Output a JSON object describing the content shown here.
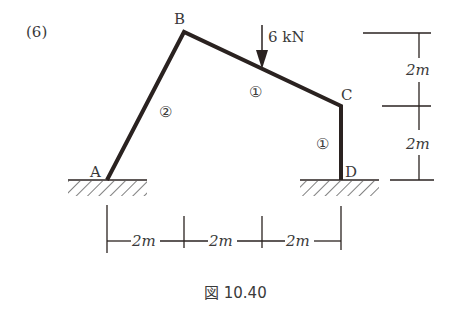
{
  "problem_label": "(6)",
  "nodes": {
    "A": {
      "label": "A"
    },
    "B": {
      "label": "B"
    },
    "C": {
      "label": "C"
    },
    "D": {
      "label": "D"
    }
  },
  "members": [
    {
      "id": "AB",
      "stiffness_label": "②"
    },
    {
      "id": "BC",
      "stiffness_label": "①"
    },
    {
      "id": "CD",
      "stiffness_label": "①"
    }
  ],
  "load": {
    "label": "6 kN",
    "value": 6,
    "unit": "kN",
    "direction": "down"
  },
  "dimensions": {
    "horizontal": [
      "2m",
      "2m",
      "2m"
    ],
    "vertical": [
      "2m",
      "2m"
    ]
  },
  "caption": "図 10.40",
  "colors": {
    "line": "#2a2220",
    "text": "#3a3a3a"
  }
}
